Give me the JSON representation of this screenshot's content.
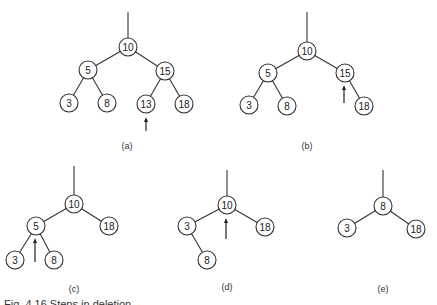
{
  "figure": {
    "caption": "Fig. 4.16 Steps in deletion",
    "node_radius": 9,
    "stroke_color": "#333333",
    "panels": [
      {
        "id": "a",
        "label": "(a)",
        "label_pos": [
          127,
          149
        ],
        "root_line": [
          128,
          12,
          128,
          38
        ],
        "nodes": [
          {
            "id": "a10",
            "value": "10",
            "x": 128,
            "y": 47
          },
          {
            "id": "a5",
            "value": "5",
            "x": 88,
            "y": 70
          },
          {
            "id": "a15",
            "value": "15",
            "x": 165,
            "y": 71
          },
          {
            "id": "a3",
            "value": "3",
            "x": 69,
            "y": 103
          },
          {
            "id": "a8",
            "value": "8",
            "x": 107,
            "y": 103
          },
          {
            "id": "a13",
            "value": "13",
            "x": 146,
            "y": 104
          },
          {
            "id": "a18",
            "value": "18",
            "x": 184,
            "y": 104
          }
        ],
        "edges": [
          [
            "a10",
            "a5"
          ],
          [
            "a10",
            "a15"
          ],
          [
            "a5",
            "a3"
          ],
          [
            "a5",
            "a8"
          ],
          [
            "a15",
            "a13"
          ],
          [
            "a15",
            "a18"
          ]
        ],
        "arrow": {
          "x": 146,
          "y_from": 131,
          "y_to": 117
        }
      },
      {
        "id": "b",
        "label": "(b)",
        "label_pos": [
          307,
          149
        ],
        "root_line": [
          307,
          12,
          307,
          42
        ],
        "nodes": [
          {
            "id": "b10",
            "value": "10",
            "x": 307,
            "y": 51
          },
          {
            "id": "b5",
            "value": "5",
            "x": 268,
            "y": 73
          },
          {
            "id": "b15",
            "value": "15",
            "x": 345,
            "y": 73
          },
          {
            "id": "b3",
            "value": "3",
            "x": 249,
            "y": 105
          },
          {
            "id": "b8",
            "value": "8",
            "x": 287,
            "y": 106
          },
          {
            "id": "b18",
            "value": "18",
            "x": 364,
            "y": 106
          }
        ],
        "edges": [
          [
            "b10",
            "b5"
          ],
          [
            "b10",
            "b15"
          ],
          [
            "b5",
            "b3"
          ],
          [
            "b5",
            "b8"
          ],
          [
            "b15",
            "b18"
          ]
        ],
        "arrow": {
          "x": 344,
          "y_from": 103,
          "y_to": 85
        }
      },
      {
        "id": "c",
        "label": "(c)",
        "label_pos": [
          74,
          292
        ],
        "root_line": [
          74,
          166,
          74,
          195
        ],
        "nodes": [
          {
            "id": "c10",
            "value": "10",
            "x": 74,
            "y": 204
          },
          {
            "id": "c5",
            "value": "5",
            "x": 36,
            "y": 226
          },
          {
            "id": "c18",
            "value": "18",
            "x": 109,
            "y": 226
          },
          {
            "id": "c3",
            "value": "3",
            "x": 15,
            "y": 260
          },
          {
            "id": "c8",
            "value": "8",
            "x": 54,
            "y": 260
          }
        ],
        "edges": [
          [
            "c10",
            "c5"
          ],
          [
            "c10",
            "c18"
          ],
          [
            "c5",
            "c3"
          ],
          [
            "c5",
            "c8"
          ]
        ],
        "arrow": {
          "x": 35,
          "y_from": 262,
          "y_to": 238
        }
      },
      {
        "id": "d",
        "label": "(d)",
        "label_pos": [
          227,
          290
        ],
        "root_line": [
          227,
          170,
          227,
          196
        ],
        "nodes": [
          {
            "id": "d10",
            "value": "10",
            "x": 227,
            "y": 205
          },
          {
            "id": "d3",
            "value": "3",
            "x": 187,
            "y": 226
          },
          {
            "id": "d18",
            "value": "18",
            "x": 265,
            "y": 227
          },
          {
            "id": "d8",
            "value": "8",
            "x": 207,
            "y": 260
          }
        ],
        "edges": [
          [
            "d10",
            "d3"
          ],
          [
            "d10",
            "d18"
          ],
          [
            "d3",
            "d8"
          ]
        ],
        "arrow": {
          "x": 226,
          "y_from": 239,
          "y_to": 218
        }
      },
      {
        "id": "e",
        "label": "(e)",
        "label_pos": [
          383,
          292
        ],
        "root_line": [
          383,
          170,
          383,
          197
        ],
        "nodes": [
          {
            "id": "e8",
            "value": "8",
            "x": 383,
            "y": 206
          },
          {
            "id": "e3",
            "value": "3",
            "x": 347,
            "y": 228
          },
          {
            "id": "e18",
            "value": "18",
            "x": 416,
            "y": 229
          }
        ],
        "edges": [
          [
            "e8",
            "e3"
          ],
          [
            "e8",
            "e18"
          ]
        ],
        "arrow": null
      }
    ]
  }
}
